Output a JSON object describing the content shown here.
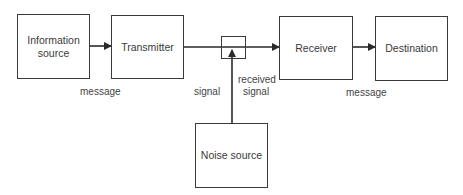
{
  "diagram": {
    "nodes": [
      {
        "id": "info-source",
        "label_line1": "Information",
        "label_line2": "source"
      },
      {
        "id": "transmitter",
        "label": "Transmitter"
      },
      {
        "id": "mixer",
        "label": ""
      },
      {
        "id": "receiver",
        "label": "Receiver"
      },
      {
        "id": "destination",
        "label": "Destination"
      },
      {
        "id": "noise-source",
        "label": "Noise source"
      }
    ],
    "edge_labels": {
      "message_left": "message",
      "signal": "signal",
      "received_signal_line1": "received",
      "received_signal_line2": "signal",
      "message_right": "message"
    },
    "edges": [
      {
        "from": "info-source",
        "to": "transmitter",
        "label": "message"
      },
      {
        "from": "transmitter",
        "to": "receiver",
        "label": "signal",
        "via": "mixer"
      },
      {
        "from": "noise-source",
        "to": "mixer",
        "label": "received signal"
      },
      {
        "from": "receiver",
        "to": "destination",
        "label": "message"
      }
    ],
    "colors": {
      "stroke": "#3a3a3a",
      "background": "#ffffff"
    }
  }
}
